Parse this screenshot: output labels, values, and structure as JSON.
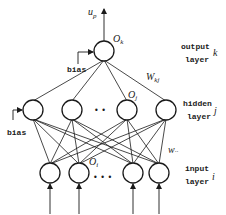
{
  "diagram": {
    "output_layer": {
      "label_line1": "output",
      "label_line2": "layer",
      "index": "k",
      "node_label": "O",
      "node_sub": "k",
      "output_label": "u",
      "output_sub": "p",
      "bias_label": "bias",
      "node_count": 1
    },
    "weights_kj": {
      "label": "W",
      "sub": "kj"
    },
    "hidden_layer": {
      "label_line1": "hidden",
      "label_line2": "layer",
      "index": "j",
      "node_label": "O",
      "node_sub": "j",
      "bias_label": "bias",
      "visible_nodes": 4,
      "ellipsis": "• •"
    },
    "weights_ji": {
      "label": "w",
      "sub": "··"
    },
    "input_layer": {
      "label_line1": "input",
      "label_line2": "layer",
      "index": "i",
      "node_label": "O",
      "node_sub": "i",
      "visible_nodes": 4,
      "ellipsis": "• • •"
    },
    "colors": {
      "ink": "#1a1a1a",
      "background": "#ffffff"
    }
  }
}
